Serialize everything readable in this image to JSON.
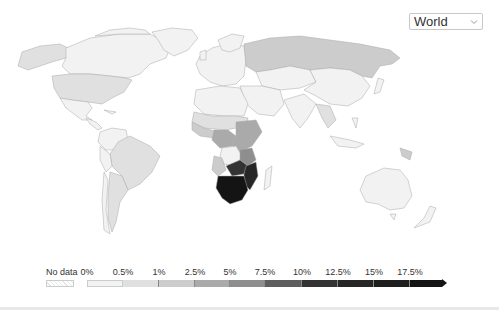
{
  "region_selector": {
    "selected": "World",
    "icon": "chevron-down-icon"
  },
  "legend": {
    "no_data_label": "No data",
    "ticks": [
      "0%",
      "0.5%",
      "1%",
      "2.5%",
      "5%",
      "7.5%",
      "10%",
      "12.5%",
      "15%",
      "17.5%"
    ],
    "bin_colors": [
      "#f2f2f2",
      "#e0e0e0",
      "#cccccc",
      "#aaaaaa",
      "#8e8e8e",
      "#5e5e5e",
      "#333333",
      "#262626",
      "#1e1e1e"
    ],
    "open_ended_color": "#141414"
  },
  "colors": {
    "ocean": "#ffffff",
    "border": "#a9a9a9",
    "bottom_bar": "#e8e8e8"
  },
  "map": {
    "type": "choropleth",
    "projection": "world",
    "regions": [
      {
        "name": "Canada",
        "shade": "#f2f2f2"
      },
      {
        "name": "Alaska",
        "shade": "#e0e0e0"
      },
      {
        "name": "United States",
        "shade": "#e0e0e0"
      },
      {
        "name": "Greenland",
        "shade": "#f2f2f2"
      },
      {
        "name": "Mexico",
        "shade": "#f2f2f2"
      },
      {
        "name": "Central America",
        "shade": "#f2f2f2"
      },
      {
        "name": "Brazil",
        "shade": "#e0e0e0"
      },
      {
        "name": "Argentina",
        "shade": "#e0e0e0"
      },
      {
        "name": "South America North",
        "shade": "#f2f2f2"
      },
      {
        "name": "Europe",
        "shade": "#f2f2f2"
      },
      {
        "name": "Russia",
        "shade": "#cccccc"
      },
      {
        "name": "Central Asia",
        "shade": "#f2f2f2"
      },
      {
        "name": "China",
        "shade": "#f2f2f2"
      },
      {
        "name": "Middle East",
        "shade": "#f2f2f2"
      },
      {
        "name": "India",
        "shade": "#f2f2f2"
      },
      {
        "name": "Southeast Asia",
        "shade": "#e0e0e0"
      },
      {
        "name": "North Africa",
        "shade": "#f2f2f2"
      },
      {
        "name": "Sahel",
        "shade": "#e0e0e0"
      },
      {
        "name": "West Africa",
        "shade": "#cccccc"
      },
      {
        "name": "Central Africa",
        "shade": "#aaaaaa"
      },
      {
        "name": "East Africa",
        "shade": "#aaaaaa"
      },
      {
        "name": "DR Congo",
        "shade": "#f2f2f2"
      },
      {
        "name": "Angola",
        "shade": "#cccccc"
      },
      {
        "name": "Zambia",
        "shade": "#333333"
      },
      {
        "name": "Mozambique",
        "shade": "#262626"
      },
      {
        "name": "Southern Africa",
        "shade": "#141414"
      },
      {
        "name": "Madagascar",
        "shade": "#f2f2f2"
      },
      {
        "name": "Australia",
        "shade": "#f2f2f2"
      },
      {
        "name": "Papua New Guinea",
        "shade": "#cccccc"
      },
      {
        "name": "New Zealand",
        "shade": "#f2f2f2"
      },
      {
        "name": "Japan",
        "shade": "#f2f2f2"
      }
    ]
  }
}
